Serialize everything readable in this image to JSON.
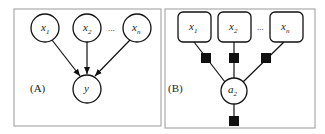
{
  "panel_a": {
    "label": "(A)",
    "inputs": [
      {
        "var": "x",
        "sub": "1"
      },
      {
        "var": "x",
        "sub": "2"
      },
      {
        "var": "x",
        "sub": "n"
      }
    ],
    "ellipsis": "...",
    "output": {
      "var": "y"
    }
  },
  "panel_b": {
    "label": "(B)",
    "inputs": [
      {
        "var": "x",
        "sub": "1"
      },
      {
        "var": "x",
        "sub": "2"
      },
      {
        "var": "x",
        "sub": "n"
      }
    ],
    "ellipsis": "...",
    "center": {
      "var": "a",
      "sub": "2"
    }
  }
}
